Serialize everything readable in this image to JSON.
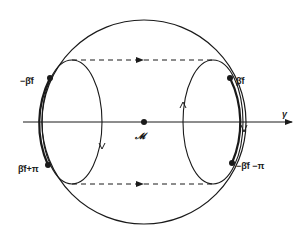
{
  "diagram": {
    "axis_label": "γ",
    "center_label": "𝓜",
    "points": {
      "upper_left": "−β̂f",
      "upper_right": "β̂f",
      "lower_left": "β̂f+π",
      "lower_right": "−β̂f −π"
    },
    "colors": {
      "line": "#1a1a1a",
      "background": "#ffffff"
    }
  }
}
